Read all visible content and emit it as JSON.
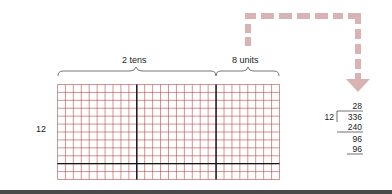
{
  "diagram": {
    "grid": {
      "rows": 12,
      "columns": 28,
      "thick_vertical_after_columns": [
        10,
        20
      ],
      "thick_horizontal_after_row": 10,
      "line_color": "#c0464a",
      "thick_color": "#111111"
    },
    "labels": {
      "row_count": "12",
      "tens_brace": "2 tens",
      "units_brace": "8 units"
    },
    "arrow": {
      "style": "dashed",
      "color": "#d9b3b3",
      "direction": "down"
    },
    "long_division": {
      "quotient": "28",
      "divisor": "12",
      "dividend": "336",
      "step1_subtract": "240",
      "remainder1": "96",
      "step2_subtract": "96"
    }
  }
}
